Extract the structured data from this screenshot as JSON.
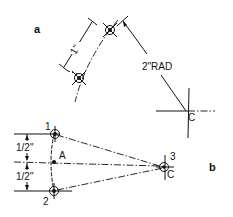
{
  "figure": {
    "part_a": {
      "label": "a",
      "dimension_chord": "1\"",
      "dimension_radius": "2\"RAD",
      "center_label": "C"
    },
    "part_b": {
      "label": "b",
      "point_1": "1",
      "point_2": "2",
      "point_3": "3",
      "midpoint_label": "A",
      "center_label": "C",
      "dimension_upper": "1/2\"",
      "dimension_lower": "1/2\""
    },
    "colors": {
      "ink": "#111111",
      "background": "#ffffff"
    }
  }
}
